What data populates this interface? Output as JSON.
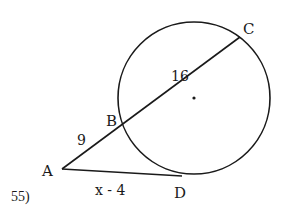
{
  "problem": {
    "number": "55)"
  },
  "points": {
    "A": "A",
    "B": "B",
    "C": "C",
    "D": "D"
  },
  "measures": {
    "AB": "9",
    "BC": "16",
    "AD": "x - 4"
  },
  "figure": {
    "stroke_color": "#1a1a1a",
    "background": "#ffffff"
  }
}
